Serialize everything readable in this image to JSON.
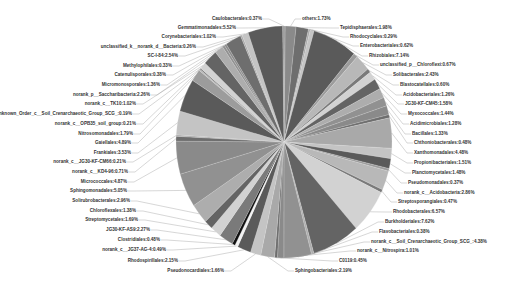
{
  "chart_data": {
    "type": "pie",
    "title": "",
    "legend": "none",
    "labels_format": "name:percent",
    "slices": [
      {
        "name": "others",
        "value": 1.73
      },
      {
        "name": "Tepidisphaerales",
        "value": 1.98
      },
      {
        "name": "Rhodocyclales",
        "value": 0.29
      },
      {
        "name": "Enterobacteriales",
        "value": 0.62
      },
      {
        "name": "Rhizobiales",
        "value": 7.14
      },
      {
        "name": "unclassified_p__Chloroflexi",
        "value": 0.67
      },
      {
        "name": "Solibacterales",
        "value": 2.43
      },
      {
        "name": "Blastocatellales",
        "value": 0.6
      },
      {
        "name": "Acidobacteriales",
        "value": 1.26
      },
      {
        "name": "JG30-KF-CM45",
        "value": 1.58
      },
      {
        "name": "Myxococcales",
        "value": 1.44
      },
      {
        "name": "Acidimicrobiales",
        "value": 1.28
      },
      {
        "name": "Bacillales",
        "value": 1.33
      },
      {
        "name": "Chthoniobacterales",
        "value": 0.48
      },
      {
        "name": "Xanthomonadales",
        "value": 4.48
      },
      {
        "name": "Propionibacteriales",
        "value": 1.51
      },
      {
        "name": "Planctomycetales",
        "value": 1.48
      },
      {
        "name": "Pseudomonadales",
        "value": 0.37
      },
      {
        "name": "norank_c__Acidobacteria",
        "value": 2.86
      },
      {
        "name": "Streptosporangiales",
        "value": 0.47
      },
      {
        "name": "Rhodobacterales",
        "value": 6.57
      },
      {
        "name": "Burkholderiales",
        "value": 7.62
      },
      {
        "name": "Flavobacteriales",
        "value": 0.38
      },
      {
        "name": "norank_c__Soil_Crenarchaeotic_Group_SCG_",
        "value": 4.38
      },
      {
        "name": "norank_c__Nitrospira",
        "value": 1.01
      },
      {
        "name": "C0119",
        "value": 0.45
      },
      {
        "name": "Sphingobacteriales",
        "value": 2.19
      },
      {
        "name": "Pseudonocardiales",
        "value": 1.66
      },
      {
        "name": "Rhodospirillales",
        "value": 2.15
      },
      {
        "name": "norank_c__JG37-AG-4",
        "value": 0.49
      },
      {
        "name": "Clostridiales",
        "value": 0.48
      },
      {
        "name": "JG30-KF-AS9",
        "value": 2.27
      },
      {
        "name": "Streptomycetales",
        "value": 1.69
      },
      {
        "name": "Chloroflexales",
        "value": 1.38
      },
      {
        "name": "Solirubrobacterales",
        "value": 2.96
      },
      {
        "name": "Sphingomonadales",
        "value": 5.05
      },
      {
        "name": "Micrococcales",
        "value": 4.87
      },
      {
        "name": "norank_c__KD4-96",
        "value": 0.71
      },
      {
        "name": "norank_c__JG30-KF-CM66",
        "value": 0.21
      },
      {
        "name": "Frankiales",
        "value": 3.53
      },
      {
        "name": "Gaiellales",
        "value": 4.89
      },
      {
        "name": "Nitrosomonadales",
        "value": 1.79
      },
      {
        "name": "norank_c__OPB35_soil_group",
        "value": 0.21
      },
      {
        "name": "Unknown_Order_c__Soil_Crenarchaeotic_Group_SCG_",
        "value": 0.19
      },
      {
        "name": "norank_c__TK10",
        "value": 1.02
      },
      {
        "name": "norank_p__Saccharibacteria",
        "value": 2.26
      },
      {
        "name": "Micromonosporales",
        "value": 1.36
      },
      {
        "name": "Catenulisporales",
        "value": 0.38
      },
      {
        "name": "Methylophilales",
        "value": 0.33
      },
      {
        "name": "SC-I-84",
        "value": 2.54
      },
      {
        "name": "unclassified_k__norank_d__Bacteria",
        "value": 0.26
      },
      {
        "name": "Corynebacteriales",
        "value": 1.02
      },
      {
        "name": "Gemmatimonadales",
        "value": 5.52
      },
      {
        "name": "Caulobacterales",
        "value": 0.37
      }
    ]
  },
  "labels": [
    {
      "text": "Caulobacterales:0.37%",
      "x": 262,
      "y": 19,
      "side": "left"
    },
    {
      "text": "others:1.73%",
      "x": 302,
      "y": 19,
      "side": "right"
    },
    {
      "text": "Gemmatimonadales:5.52%",
      "x": 236,
      "y": 28,
      "side": "left"
    },
    {
      "text": "Tepidisphaerales:1.98%",
      "x": 340,
      "y": 28,
      "side": "right"
    },
    {
      "text": "Corynebacteriales:1.02%",
      "x": 216,
      "y": 37,
      "side": "left"
    },
    {
      "text": "Rhodocyclales:0.29%",
      "x": 350,
      "y": 37,
      "side": "right"
    },
    {
      "text": "unclassified_k__norank_d__Bacteria:0.26%",
      "x": 196,
      "y": 47,
      "side": "left"
    },
    {
      "text": "Enterobacteriales:0.62%",
      "x": 360,
      "y": 46,
      "side": "right"
    },
    {
      "text": "SC-I-84:2.54%",
      "x": 178,
      "y": 56,
      "side": "left"
    },
    {
      "text": "Rhizobiales:7.14%",
      "x": 369,
      "y": 56,
      "side": "right"
    },
    {
      "text": "Methylophilales:0.33%",
      "x": 172,
      "y": 66,
      "side": "left"
    },
    {
      "text": "unclassified_p__Chloroflexi:0.67%",
      "x": 380,
      "y": 65,
      "side": "right"
    },
    {
      "text": "Catenulisporales:0.38%",
      "x": 166,
      "y": 75,
      "side": "left"
    },
    {
      "text": "Solibacterales:2.43%",
      "x": 393,
      "y": 75,
      "side": "right"
    },
    {
      "text": "Micromonosporales:1.36%",
      "x": 160,
      "y": 85,
      "side": "left"
    },
    {
      "text": "Blastocatellales:0.60%",
      "x": 400,
      "y": 85,
      "side": "right"
    },
    {
      "text": "norank_p__Saccharibacteria:2.26%",
      "x": 150,
      "y": 95,
      "side": "left"
    },
    {
      "text": "Acidobacteriales:1.26%",
      "x": 403,
      "y": 95,
      "side": "right"
    },
    {
      "text": "norank_c__TK10:1.02%",
      "x": 136,
      "y": 104,
      "side": "left"
    },
    {
      "text": "JG30-KF-CM45:1.58%",
      "x": 405,
      "y": 104,
      "side": "right"
    },
    {
      "text": "Unknown_Order_c__Soil_Crenarchaeotic_Group_SCG_:0.19%",
      "x": 132,
      "y": 114,
      "side": "left"
    },
    {
      "text": "Myxococcales:1.44%",
      "x": 408,
      "y": 114,
      "side": "right"
    },
    {
      "text": "norank_c__OPB35_soil_group:0.21%",
      "x": 136,
      "y": 124,
      "side": "left"
    },
    {
      "text": "Acidimicrobiales:1.28%",
      "x": 410,
      "y": 124,
      "side": "right"
    },
    {
      "text": "Nitrosomonadales:1.79%",
      "x": 133,
      "y": 134,
      "side": "left"
    },
    {
      "text": "Bacillales:1.33%",
      "x": 412,
      "y": 134,
      "side": "right"
    },
    {
      "text": "Gaiellales:4.89%",
      "x": 131,
      "y": 143,
      "side": "left"
    },
    {
      "text": "Chthoniobacterales:0.48%",
      "x": 414,
      "y": 143,
      "side": "right"
    },
    {
      "text": "Frankiales:3.53%",
      "x": 131,
      "y": 153,
      "side": "left"
    },
    {
      "text": "Xanthomonadales:4.48%",
      "x": 414,
      "y": 153,
      "side": "right"
    },
    {
      "text": "norank_c__JG30-KF-CM66:0.21%",
      "x": 126,
      "y": 162,
      "side": "left"
    },
    {
      "text": "Propionibacteriales:1.51%",
      "x": 414,
      "y": 163,
      "side": "right"
    },
    {
      "text": "norank_c__KD4-96:0.71%",
      "x": 128,
      "y": 172,
      "side": "left"
    },
    {
      "text": "Planctomycetales:1.48%",
      "x": 412,
      "y": 173,
      "side": "right"
    },
    {
      "text": "Micrococcales:4.87%",
      "x": 127,
      "y": 182,
      "side": "left"
    },
    {
      "text": "Pseudomonadales:0.37%",
      "x": 408,
      "y": 183,
      "side": "right"
    },
    {
      "text": "Sphingomonadales:5.05%",
      "x": 127,
      "y": 191,
      "side": "left"
    },
    {
      "text": "norank_c__Acidobacteria:2.86%",
      "x": 404,
      "y": 193,
      "side": "right"
    },
    {
      "text": "Solirubrobacterales:2.96%",
      "x": 130,
      "y": 201,
      "side": "left"
    },
    {
      "text": "Streptosporangiales:0.47%",
      "x": 398,
      "y": 202,
      "side": "right"
    },
    {
      "text": "Chloroflexales:1.38%",
      "x": 136,
      "y": 211,
      "side": "left"
    },
    {
      "text": "Rhodobacterales:6.57%",
      "x": 393,
      "y": 212,
      "side": "right"
    },
    {
      "text": "Streptomycetales:1.69%",
      "x": 138,
      "y": 220,
      "side": "left"
    },
    {
      "text": "Burkholderiales:7.62%",
      "x": 385,
      "y": 222,
      "side": "right"
    },
    {
      "text": "JG30-KF-AS9:2.27%",
      "x": 150,
      "y": 230,
      "side": "left"
    },
    {
      "text": "Flavobacteriales:0.38%",
      "x": 379,
      "y": 232,
      "side": "right"
    },
    {
      "text": "Clostridiales:0.48%",
      "x": 160,
      "y": 240,
      "side": "left"
    },
    {
      "text": "norank_c__Soil_Crenarchaeotic_Group_SCG_:4.38%",
      "x": 371,
      "y": 242,
      "side": "right"
    },
    {
      "text": "norank_c__JG37-AG-4:0.49%",
      "x": 166,
      "y": 250,
      "side": "left"
    },
    {
      "text": "norank_c__Nitrospira:1.01%",
      "x": 357,
      "y": 251,
      "side": "right"
    },
    {
      "text": "Rhodospirillales:2.15%",
      "x": 178,
      "y": 261,
      "side": "left"
    },
    {
      "text": "C0119:0.45%",
      "x": 339,
      "y": 261,
      "side": "right"
    },
    {
      "text": "Pseudonocardiales:1.66%",
      "x": 224,
      "y": 271,
      "side": "left"
    },
    {
      "text": "Sphingobacteriales:2.19%",
      "x": 295,
      "y": 271,
      "side": "right"
    }
  ]
}
